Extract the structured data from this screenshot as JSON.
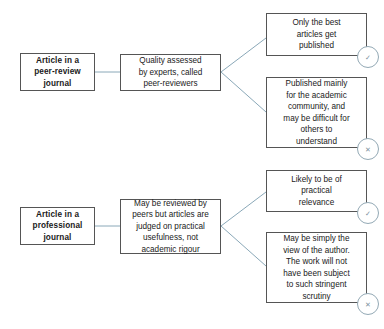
{
  "diagram": {
    "colors": {
      "background": "#ffffff",
      "box_border": "#555555",
      "connector": "#8aa8b8",
      "badge_border": "#93a9b5",
      "text": "#1a1a1a"
    },
    "branches": [
      {
        "id": "peer-review",
        "source": {
          "label": "Article in a\npeer-review\njournal"
        },
        "process": {
          "label": "Quality assessed\nby experts, called\npeer-reviewers"
        },
        "outcomes": [
          {
            "label": "Only the best\narticles get\npublished",
            "badge": "✓",
            "badge_name": "check-icon",
            "sentiment": "positive"
          },
          {
            "label": "Published mainly\nfor the academic\ncommunity, and\nmay be difficult for\nothers to\nunderstand",
            "badge": "✕",
            "badge_name": "cross-icon",
            "sentiment": "negative"
          }
        ]
      },
      {
        "id": "professional",
        "source": {
          "label": "Article in a\nprofessional\njournal"
        },
        "process": {
          "label": "May be reviewed by\npeers but articles are\njudged on practical\nusefulness, not\nacademic rigour"
        },
        "outcomes": [
          {
            "label": "Likely to be of\npractical\nrelevance",
            "badge": "✓",
            "badge_name": "check-icon",
            "sentiment": "positive"
          },
          {
            "label": "May be simply the\nview of the author.\nThe work will not\nhave been subject\nto such stringent\nscrutiny",
            "badge": "✕",
            "badge_name": "cross-icon",
            "sentiment": "negative"
          }
        ]
      }
    ]
  }
}
